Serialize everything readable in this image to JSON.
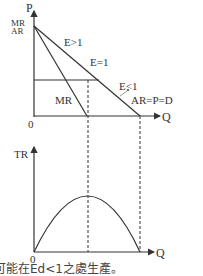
{
  "upper_graph": {
    "y_axis_label": "P",
    "y_intercept_labels": [
      "MR",
      "AR"
    ],
    "origin_label": "0",
    "x_axis_label": "Q",
    "demand_label": "AR=P=D",
    "mr_label": "MR",
    "elasticity_labels": {
      "elastic": "E>1",
      "unit": "E=1",
      "inelastic": "E<1"
    }
  },
  "lower_graph": {
    "y_axis_label": "TR",
    "origin_label": "0",
    "x_axis_label": "Q"
  },
  "caption": "可能在Ed<1之處生產。",
  "colors": {
    "line": "#333333",
    "background": "#ffffff"
  }
}
